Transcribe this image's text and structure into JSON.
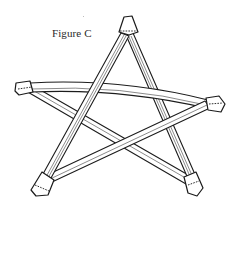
{
  "figure": {
    "label": "Figure C",
    "colors": {
      "line": "#1c1c1c",
      "background": "#ffffff"
    },
    "tips": [
      {
        "name": "top",
        "x": 128,
        "y": 17
      },
      {
        "name": "left",
        "x": 17,
        "y": 88
      },
      {
        "name": "right",
        "x": 222,
        "y": 103
      },
      {
        "name": "bottom-left",
        "x": 35,
        "y": 190
      },
      {
        "name": "bottom-right",
        "x": 197,
        "y": 193
      }
    ],
    "sticks": [
      {
        "from": "top",
        "to": "bottom-left"
      },
      {
        "from": "top",
        "to": "bottom-right"
      },
      {
        "from": "left",
        "to": "right"
      },
      {
        "from": "left",
        "to": "bottom-right"
      },
      {
        "from": "right",
        "to": "bottom-left"
      }
    ]
  }
}
